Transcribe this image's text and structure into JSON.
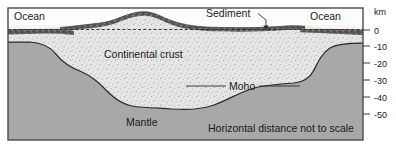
{
  "figure": {
    "caption": "Horizontal distance not to scale"
  },
  "labels": {
    "ocean_left": "Ocean",
    "ocean_right": "Ocean",
    "sediment": "Sediment",
    "continental_crust": "Continental crust",
    "moho": "Moho",
    "mantle": "Mantle",
    "axis_unit": "km",
    "caption": "Horizontal distance not to scale"
  },
  "axis": {
    "unit": "km",
    "ticks": [
      {
        "label": "0",
        "value": 0,
        "y": 30
      },
      {
        "label": "-10",
        "value": -10,
        "y": 46
      },
      {
        "label": "-20",
        "value": -20,
        "y": 63
      },
      {
        "label": "-30",
        "value": -30,
        "y": 80
      },
      {
        "label": "-40",
        "value": -40,
        "y": 97
      },
      {
        "label": "-50",
        "value": -50,
        "y": 114
      }
    ],
    "range": [
      0,
      -50
    ],
    "direction": "downward-negative"
  },
  "layers": [
    {
      "name": "ocean-water",
      "label": "Ocean",
      "color": "#efefef"
    },
    {
      "name": "sediment",
      "label": "Sediment",
      "color": "#55524d"
    },
    {
      "name": "continental-crust",
      "label": "Continental crust",
      "color": "#e3e3e3",
      "texture": "stipple"
    },
    {
      "name": "mantle",
      "label": "Mantle",
      "color": "#a8a8a8"
    }
  ],
  "boundaries": [
    {
      "name": "sea-level",
      "style": "dashed",
      "value_km": 0
    },
    {
      "name": "moho",
      "label": "Moho",
      "style": "solid",
      "description": "crust-mantle boundary"
    }
  ],
  "colors": {
    "mantle": "#a8a8a8",
    "crust": "#e4e4e4",
    "sediment": "#55524d",
    "ocean": "#f0f0f0",
    "border": "#4a4a4a",
    "text": "#1a1a1a",
    "background": "#ffffff"
  }
}
